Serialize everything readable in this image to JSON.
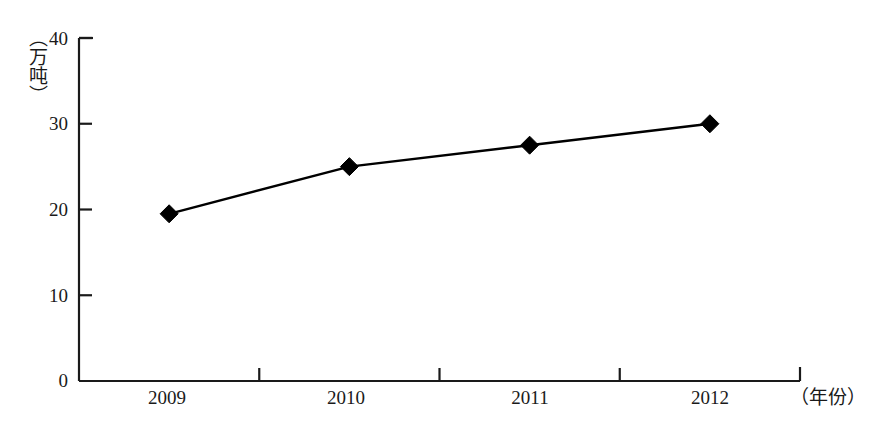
{
  "chart_data": {
    "type": "line",
    "title": "",
    "subtitle": "",
    "xlabel": "（年份）",
    "ylabel": "（万吨）",
    "categories": [
      "2009",
      "2010",
      "2011",
      "2012"
    ],
    "series": [
      {
        "name": "产量",
        "values": [
          19.5,
          25.0,
          27.5,
          30.0
        ]
      }
    ],
    "ylim": [
      0,
      40
    ],
    "yticks": [
      "0",
      "10",
      "20",
      "30",
      "40"
    ],
    "ytick_values": [
      0,
      10,
      20,
      30,
      40
    ],
    "xticks": [
      "2009",
      "2010",
      "2011",
      "2012"
    ],
    "grid": false,
    "legend": null,
    "legend_position": "none",
    "marker": "diamond",
    "line_color": "#000000",
    "marker_color": "#000000",
    "background_color": "#ffffff",
    "axis_color": "#1a1a1a",
    "annotations": []
  },
  "axes": {
    "y_title": "（万吨）",
    "x_title": "（年份）"
  }
}
